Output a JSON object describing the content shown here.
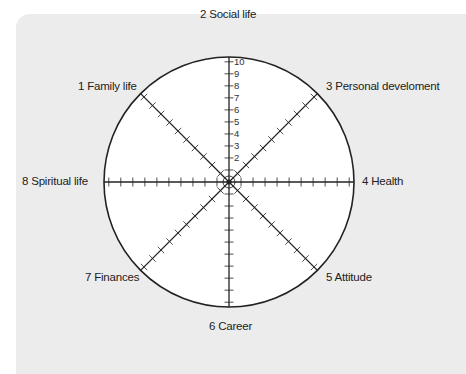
{
  "diagram": {
    "type": "wheel-of-life",
    "scale": {
      "min": 1,
      "max": 10,
      "labels": [
        "2",
        "3",
        "4",
        "5",
        "6",
        "7",
        "8",
        "9",
        "10"
      ]
    },
    "segments": [
      {
        "number": 1,
        "label": "1 Family life"
      },
      {
        "number": 2,
        "label": "2 Social life"
      },
      {
        "number": 3,
        "label": "3 Personal develoment"
      },
      {
        "number": 4,
        "label": "4 Health"
      },
      {
        "number": 5,
        "label": "5 Attitude"
      },
      {
        "number": 6,
        "label": "6 Career"
      },
      {
        "number": 7,
        "label": "7 Finances"
      },
      {
        "number": 8,
        "label": "8 Spiritual life"
      }
    ]
  },
  "colors": {
    "panel": "#ececec",
    "circle_fill": "#ffffff",
    "stroke": "#222222"
  }
}
